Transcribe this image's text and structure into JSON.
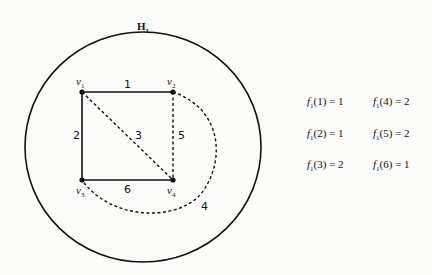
{
  "graph": {
    "title": "H",
    "title_sub": "1",
    "vertices": [
      {
        "name": "v",
        "sub": "1",
        "x": 82,
        "y": 92
      },
      {
        "name": "v",
        "sub": "2",
        "x": 173,
        "y": 92
      },
      {
        "name": "v",
        "sub": "3",
        "x": 82,
        "y": 180
      },
      {
        "name": "v",
        "sub": "4",
        "x": 173,
        "y": 180
      }
    ],
    "edges": [
      {
        "label": "1",
        "from": "v1",
        "to": "v2",
        "style": "solid"
      },
      {
        "label": "2",
        "from": "v1",
        "to": "v3",
        "style": "solid"
      },
      {
        "label": "3",
        "from": "v1",
        "to": "v4",
        "style": "dashed"
      },
      {
        "label": "4",
        "from": "v2",
        "to": "v3",
        "style": "dashed-curve"
      },
      {
        "label": "5",
        "from": "v2",
        "to": "v4",
        "style": "dashed"
      },
      {
        "label": "6",
        "from": "v3",
        "to": "v4",
        "style": "solid"
      }
    ]
  },
  "function": {
    "name": "f",
    "sub": "1",
    "values": [
      {
        "arg": "1",
        "value": "1"
      },
      {
        "arg": "2",
        "value": "1"
      },
      {
        "arg": "3",
        "value": "2"
      },
      {
        "arg": "4",
        "value": "2"
      },
      {
        "arg": "5",
        "value": "2"
      },
      {
        "arg": "6",
        "value": "1"
      }
    ]
  }
}
